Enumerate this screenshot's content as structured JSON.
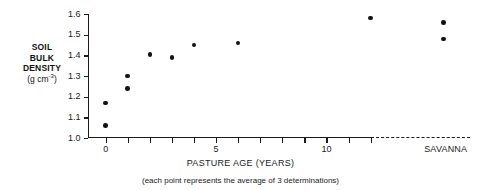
{
  "chart_data": {
    "type": "scatter",
    "title": "",
    "xlabel": "PASTURE AGE (YEARS)",
    "ylabel": "SOIL BULK DENSITY (g cm-3)",
    "ylabel_lines": [
      "SOIL",
      "BULK",
      "DENSITY"
    ],
    "ylabel_unit": "(g cm",
    "ylabel_unit_sup": "-3",
    "ylabel_unit_close": ")",
    "note": "(each point represents the average of 3 determinations)",
    "xlim": [
      -0.8,
      16.5
    ],
    "ylim": [
      1.0,
      1.6
    ],
    "grid": false,
    "legend": false,
    "y_ticks": [
      1.0,
      1.1,
      1.2,
      1.3,
      1.4,
      1.5,
      1.6
    ],
    "y_tick_labels": [
      "1.0",
      "1.1",
      "1.2",
      "1.3",
      "1.4",
      "1.5",
      "1.6"
    ],
    "x_ticks": [
      0,
      1,
      2,
      3,
      4,
      5,
      6,
      7,
      8,
      9,
      10,
      11,
      12
    ],
    "x_tick_labels": [
      {
        "value": 0,
        "label": "0"
      },
      {
        "value": 5,
        "label": "5"
      },
      {
        "value": 10,
        "label": "10"
      }
    ],
    "x_axis_solid_to": 12,
    "x_axis_dashed_from": 12,
    "savanna_label": "SAVANNA",
    "savanna_x": 15.4,
    "points": [
      {
        "x": 0,
        "y": 1.17
      },
      {
        "x": 0,
        "y": 1.06
      },
      {
        "x": 1,
        "y": 1.3
      },
      {
        "x": 1,
        "y": 1.24
      },
      {
        "x": 2,
        "y": 1.405
      },
      {
        "x": 3,
        "y": 1.39
      },
      {
        "x": 4,
        "y": 1.45
      },
      {
        "x": 6,
        "y": 1.46
      },
      {
        "x": 12,
        "y": 1.58
      },
      {
        "x": 15.3,
        "y": 1.56
      },
      {
        "x": 15.3,
        "y": 1.48
      }
    ],
    "colors": {
      "point": "#121212",
      "axis": "#1b1b1b",
      "background": "#ffffff"
    }
  }
}
